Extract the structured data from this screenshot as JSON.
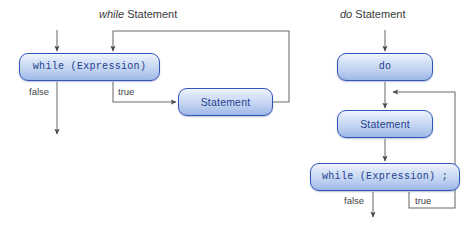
{
  "figure": {
    "background_color": "#ffffff",
    "node_border_color": "#3355bb",
    "node_text_color": "#24428f",
    "line_color": "#5a5a5a",
    "label_text_color": "#444444"
  },
  "diagrams": [
    {
      "id": "while-statement",
      "title_keyword": "while",
      "title_rest": " Statement",
      "nodes": [
        {
          "id": "while-condition",
          "text": "while (Expression)",
          "font": "mono"
        },
        {
          "id": "while-body",
          "text": "Statement",
          "font": "sans"
        }
      ],
      "edge_labels": [
        {
          "id": "while-false",
          "text": "false"
        },
        {
          "id": "while-true",
          "text": "true"
        }
      ]
    },
    {
      "id": "do-statement",
      "title_keyword": "do",
      "title_rest": " Statement",
      "nodes": [
        {
          "id": "do-keyword",
          "text": "do",
          "font": "mono"
        },
        {
          "id": "do-body",
          "text": "Statement",
          "font": "sans"
        },
        {
          "id": "do-condition",
          "text": "while (Expression) ;",
          "font": "mono"
        }
      ],
      "edge_labels": [
        {
          "id": "do-false",
          "text": "false"
        },
        {
          "id": "do-true",
          "text": "true"
        }
      ]
    }
  ]
}
